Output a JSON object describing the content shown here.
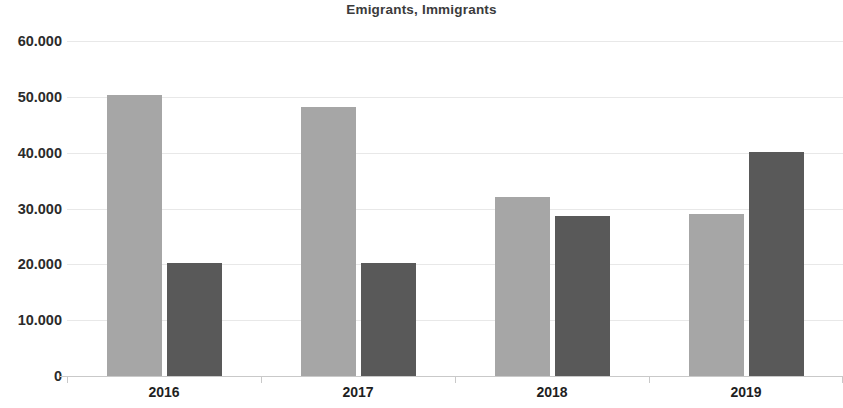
{
  "chart_data": {
    "type": "bar",
    "title": "Emigrants, Immigrants",
    "xlabel": "",
    "ylabel": "",
    "categories": [
      "2016",
      "2017",
      "2018",
      "2019"
    ],
    "series": [
      {
        "name": "Emigrants",
        "color": "#a6a6a6",
        "values": [
          50400,
          48200,
          32000,
          29100
        ]
      },
      {
        "name": "Immigrants",
        "color": "#595959",
        "values": [
          20200,
          20300,
          28700,
          40100
        ]
      }
    ],
    "ylim": [
      0,
      60000
    ],
    "ytick_values": [
      0,
      10000,
      20000,
      30000,
      40000,
      50000,
      60000
    ],
    "ytick_labels": [
      "0",
      "10.000",
      "20.000",
      "30.000",
      "40.000",
      "50.000",
      "60.000"
    ],
    "grid": true,
    "legend": "none",
    "number_format": "dot-thousands-separator"
  },
  "colors": {
    "background": "#ffffff",
    "title": "#3b3b3b",
    "tick_label": "#2b2b2b",
    "gridline": "#e8e8e8",
    "axis": "#c9c9c9",
    "series_light": "#a6a6a6",
    "series_dark": "#595959"
  }
}
